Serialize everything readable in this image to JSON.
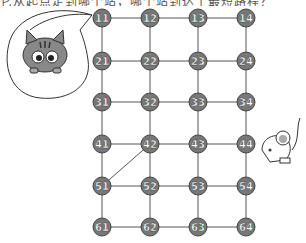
{
  "header_text": "它从起点走到哪个站，哪个站到达了最短路程？",
  "grid": {
    "rows": [
      [
        "11",
        "12",
        "13",
        "14"
      ],
      [
        "21",
        "22",
        "23",
        "24"
      ],
      [
        "31",
        "32",
        "33",
        "34"
      ],
      [
        "41",
        "42",
        "43",
        "44"
      ],
      [
        "51",
        "52",
        "53",
        "54"
      ],
      [
        "61",
        "62",
        "63",
        "64"
      ]
    ],
    "extra_edges": [
      [
        "42",
        "51"
      ]
    ]
  },
  "characters": {
    "cat": "cat-in-speech-bubble",
    "mouse": "mouse-near-44"
  },
  "colors": {
    "node_fill": "#777777",
    "line": "#555555"
  }
}
